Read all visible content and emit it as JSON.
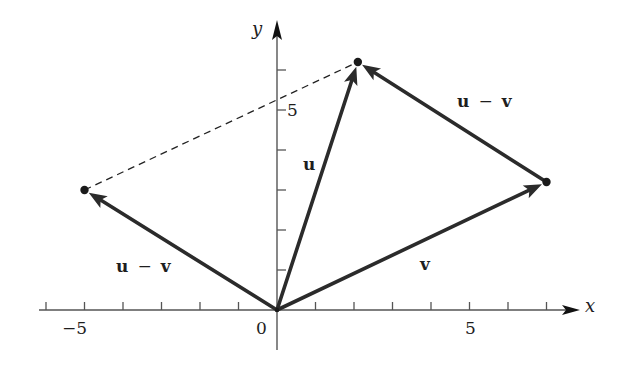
{
  "diagram": {
    "type": "vector-parallelogram",
    "colors": {
      "vector": "#2b2b2b",
      "axis": "#555555",
      "dashed": "#222222",
      "text": "#1e1e1e"
    },
    "axes": {
      "x_label": "x",
      "y_label": "y",
      "x_range": [
        -6,
        7
      ],
      "y_range": [
        0,
        6
      ],
      "tick_labels": {
        "x_neg5": "−5",
        "x_zero": "0",
        "x_pos5": "5",
        "y_pos5": "5"
      }
    },
    "vectors": [
      {
        "id": "u",
        "label": "u",
        "from": [
          0,
          0
        ],
        "to": [
          2.1,
          6.2
        ]
      },
      {
        "id": "v",
        "label": "v",
        "from": [
          0,
          0
        ],
        "to": [
          7,
          3.2
        ]
      },
      {
        "id": "u-minus-v-origin",
        "label_left": "u",
        "label_op": "−",
        "label_right": "v",
        "from": [
          0,
          0
        ],
        "to": [
          -5,
          3
        ]
      },
      {
        "id": "u-minus-v-translated",
        "label_left": "u",
        "label_op": "−",
        "label_right": "v",
        "from": [
          7,
          3.2
        ],
        "to": [
          2.1,
          6.2
        ]
      }
    ],
    "dashed_segment": {
      "from": [
        -5,
        3
      ],
      "to": [
        2.1,
        6.2
      ]
    },
    "labels": {
      "u": "u",
      "v": "v",
      "u_minus_v_left": {
        "a": "u",
        "op": "−",
        "b": "v"
      },
      "u_minus_v_right": {
        "a": "u",
        "op": "−",
        "b": "v"
      }
    }
  }
}
